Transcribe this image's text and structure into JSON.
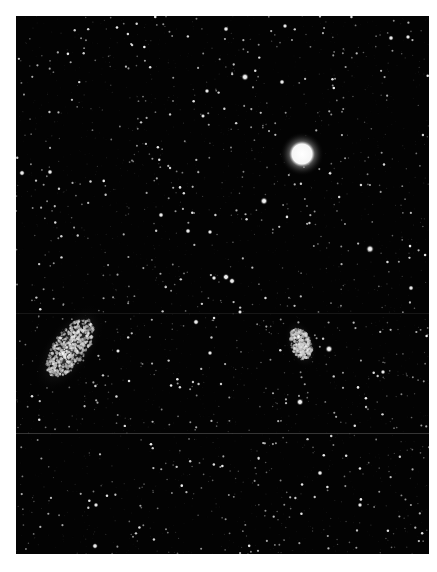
{
  "image": {
    "subject": "Night sky photograph showing the Large and Small Magellanic Clouds",
    "width": 437,
    "height": 572,
    "frame": {
      "x": 16,
      "y": 16,
      "width": 413,
      "height": 538
    },
    "background_color": "#ffffff",
    "sky_color": "#030303",
    "scanlines_y": [
      433,
      313
    ]
  },
  "features": {
    "bright_star": {
      "name": "bright-star",
      "x": 302,
      "y": 154,
      "radius": 10,
      "glow": 22
    },
    "large_magellanic_cloud": {
      "name": "large-magellanic-cloud",
      "x": 70,
      "y": 348,
      "rx": 16,
      "ry": 34,
      "rotation_deg": 35
    },
    "small_magellanic_cloud": {
      "name": "small-magellanic-cloud",
      "x": 301,
      "y": 344,
      "rx": 10,
      "ry": 17,
      "rotation_deg": -20
    }
  },
  "notable_stars": [
    [
      245,
      77,
      1.8
    ],
    [
      282,
      82,
      1.3
    ],
    [
      207,
      91,
      1.2
    ],
    [
      203,
      116,
      1.1
    ],
    [
      264,
      201,
      1.8
    ],
    [
      161,
      215,
      1.3
    ],
    [
      188,
      231,
      1.3
    ],
    [
      210,
      232,
      1.2
    ],
    [
      226,
      277,
      1.6
    ],
    [
      232,
      281,
      1.5
    ],
    [
      214,
      278,
      1.2
    ],
    [
      370,
      249,
      1.9
    ],
    [
      329,
      349,
      1.8
    ],
    [
      300,
      402,
      1.7
    ],
    [
      22,
      173,
      1.4
    ],
    [
      50,
      172,
      1.3
    ],
    [
      391,
      38,
      1.3
    ],
    [
      408,
      37,
      1.2
    ],
    [
      226,
      29,
      1.3
    ],
    [
      285,
      26,
      1.2
    ],
    [
      196,
      322,
      1.4
    ],
    [
      210,
      353,
      1.2
    ],
    [
      240,
      312,
      1.1
    ],
    [
      411,
      288,
      1.3
    ],
    [
      320,
      473,
      1.3
    ],
    [
      96,
      505,
      1.2
    ],
    [
      95,
      546,
      1.4
    ],
    [
      360,
      505,
      1.2
    ],
    [
      118,
      351,
      1.1
    ],
    [
      383,
      372,
      1.2
    ]
  ],
  "starfield": {
    "seed": 1337,
    "count": 2600
  }
}
